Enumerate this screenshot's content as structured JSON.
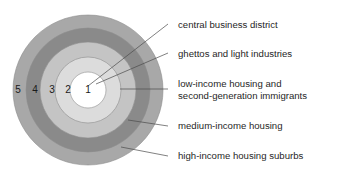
{
  "diagram": {
    "center": {
      "cx": 88,
      "cy": 90
    },
    "rings": [
      {
        "num": "5",
        "radius": 75,
        "color": "#a8a8a8",
        "label": "high-income housing suburbs",
        "num_x": 18,
        "num_y": 90
      },
      {
        "num": "4",
        "radius": 62,
        "color": "#8a8a8a",
        "label": "medium-income housing",
        "num_x": 35,
        "num_y": 90
      },
      {
        "num": "3",
        "radius": 48,
        "color": "#c4c4c4",
        "label": "low-income housing and",
        "num_x": 52,
        "num_y": 90
      },
      {
        "num": "2",
        "radius": 33,
        "color": "#dcdcdc",
        "label": "ghettos and light industries",
        "num_x": 68,
        "num_y": 90
      },
      {
        "num": "1",
        "radius": 18,
        "color": "#ffffff",
        "label": "central business district",
        "num_x": 88,
        "num_y": 90
      }
    ],
    "callouts": [
      {
        "id": "central-business-district",
        "lines": [
          "central business district"
        ],
        "text_x": 178,
        "text_y": 25,
        "leader": "M 88,86 L 168,24"
      },
      {
        "id": "ghettos-and-light-industries",
        "lines": [
          "ghettos and light industries"
        ],
        "text_x": 178,
        "text_y": 54,
        "leader": "M 96,84 L 168,53"
      },
      {
        "id": "low-income-housing",
        "lines": [
          "low-income housing and",
          "second-generation immigrants"
        ],
        "text_x": 178,
        "text_y": 84,
        "leader": "M 120,89 L 168,89"
      },
      {
        "id": "medium-income-housing",
        "lines": [
          "medium-income housing"
        ],
        "text_x": 178,
        "text_y": 126,
        "leader": "M 128,120 L 168,126"
      },
      {
        "id": "high-income-housing-suburbs",
        "lines": [
          "high-income housing suburbs"
        ],
        "text_x": 178,
        "text_y": 156,
        "leader": "M 121,147 L 168,156"
      }
    ],
    "colors": {
      "background": "#ffffff",
      "text": "#1f1f1f",
      "leader_line": "#4a4a4a",
      "ring_outline": "#8d8d8d"
    }
  }
}
